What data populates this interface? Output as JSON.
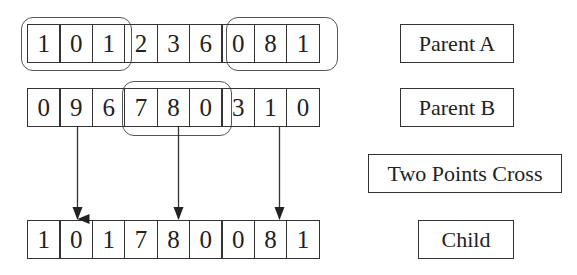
{
  "parent_a": {
    "label": "Parent A",
    "genes": [
      "1",
      "0",
      "1",
      "2",
      "3",
      "6",
      "0",
      "8",
      "1"
    ]
  },
  "parent_b": {
    "label": "Parent B",
    "genes": [
      "0",
      "9",
      "6",
      "7",
      "8",
      "0",
      "3",
      "1",
      "0"
    ]
  },
  "operation": {
    "label": "Two Points Cross"
  },
  "child": {
    "label": "Child",
    "genes": [
      "1",
      "0",
      "1",
      "7",
      "8",
      "0",
      "0",
      "8",
      "1"
    ]
  },
  "highlights": {
    "parent_a_segments": [
      [
        0,
        2
      ],
      [
        6,
        8
      ]
    ],
    "parent_b_segment": [
      3,
      5
    ]
  },
  "arrows": [
    {
      "from": "parent_b[1]",
      "to": "child[1]"
    },
    {
      "from": "parent_b[4]",
      "to": "child[4]"
    },
    {
      "from": "parent_b[7]",
      "to": "child[7]"
    }
  ]
}
